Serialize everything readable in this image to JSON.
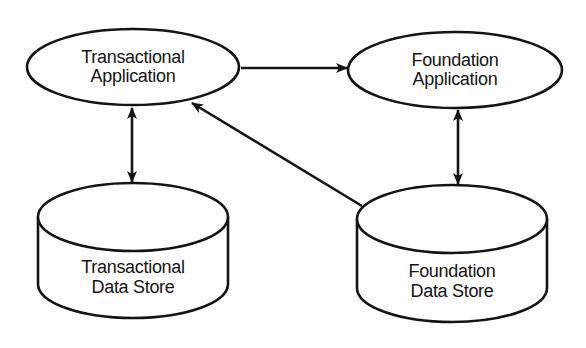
{
  "diagram": {
    "type": "data-flow",
    "nodes": [
      {
        "id": "transactional_app",
        "shape": "ellipse",
        "line1": "Transactional",
        "line2": "Application"
      },
      {
        "id": "foundation_app",
        "shape": "ellipse",
        "line1": "Foundation",
        "line2": "Application"
      },
      {
        "id": "transactional_store",
        "shape": "cylinder",
        "line1": "Transactional",
        "line2": "Data Store"
      },
      {
        "id": "foundation_store",
        "shape": "cylinder",
        "line1": "Foundation",
        "line2": "Data Store"
      }
    ],
    "edges": [
      {
        "from": "transactional_app",
        "to": "foundation_app",
        "direction": "forward"
      },
      {
        "from": "transactional_app",
        "to": "transactional_store",
        "direction": "bidirectional"
      },
      {
        "from": "foundation_app",
        "to": "foundation_store",
        "direction": "bidirectional"
      },
      {
        "from": "foundation_store",
        "to": "transactional_app",
        "direction": "forward"
      }
    ],
    "colors": {
      "stroke": "#141414",
      "fill": "#ffffff",
      "background": "#ffffff"
    }
  }
}
